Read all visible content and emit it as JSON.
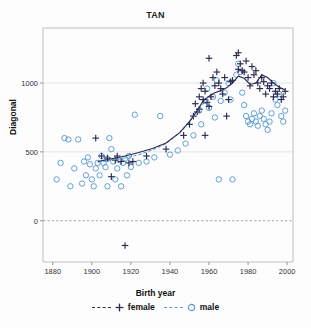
{
  "chart_data": {
    "type": "scatter",
    "title": "TAN",
    "xlabel": "Birth year",
    "ylabel": "Diagonal",
    "xlim": [
      1875,
      2003
    ],
    "ylim": [
      -300,
      1400
    ],
    "xticks": [
      1880,
      1900,
      1920,
      1940,
      1960,
      1980,
      2000
    ],
    "yticks": [
      0,
      500,
      1000
    ],
    "grid": "horizontal-faint",
    "zero_line": "dashed-gray",
    "legend_position": "bottom-center",
    "series": [
      {
        "name": "female",
        "marker": "plus",
        "color": "#2b2b52",
        "line_style": "dashed",
        "points": [
          [
            1902,
            600
          ],
          [
            1905,
            470
          ],
          [
            1908,
            455
          ],
          [
            1910,
            320
          ],
          [
            1912,
            440
          ],
          [
            1913,
            470
          ],
          [
            1915,
            430
          ],
          [
            1917,
            -180
          ],
          [
            1919,
            420
          ],
          [
            1921,
            430
          ],
          [
            1928,
            470
          ],
          [
            1938,
            520
          ],
          [
            1947,
            620
          ],
          [
            1950,
            700
          ],
          [
            1952,
            760
          ],
          [
            1953,
            850
          ],
          [
            1954,
            790
          ],
          [
            1955,
            810
          ],
          [
            1955,
            900
          ],
          [
            1956,
            960
          ],
          [
            1957,
            880
          ],
          [
            1957,
            1000
          ],
          [
            1958,
            940
          ],
          [
            1958,
            620
          ],
          [
            1959,
            860
          ],
          [
            1960,
            830
          ],
          [
            1960,
            1180
          ],
          [
            1961,
            900
          ],
          [
            1962,
            1040
          ],
          [
            1963,
            980
          ],
          [
            1964,
            1080
          ],
          [
            1965,
            1000
          ],
          [
            1966,
            960
          ],
          [
            1967,
            920
          ],
          [
            1968,
            1040
          ],
          [
            1969,
            760
          ],
          [
            1970,
            880
          ],
          [
            1971,
            1010
          ],
          [
            1972,
            1020
          ],
          [
            1974,
            1200
          ],
          [
            1975,
            1220
          ],
          [
            1975,
            1100
          ],
          [
            1976,
            1140
          ],
          [
            1977,
            1090
          ],
          [
            1978,
            1080
          ],
          [
            1979,
            1160
          ],
          [
            1980,
            1040
          ],
          [
            1981,
            980
          ],
          [
            1982,
            1120
          ],
          [
            1983,
            1060
          ],
          [
            1984,
            1090
          ],
          [
            1985,
            1000
          ],
          [
            1986,
            960
          ],
          [
            1987,
            1040
          ],
          [
            1988,
            1010
          ],
          [
            1989,
            920
          ],
          [
            1990,
            980
          ],
          [
            1991,
            960
          ],
          [
            1992,
            1000
          ],
          [
            1993,
            900
          ],
          [
            1994,
            940
          ],
          [
            1995,
            920
          ],
          [
            1996,
            960
          ],
          [
            1997,
            880
          ],
          [
            1998,
            900
          ],
          [
            1999,
            940
          ]
        ],
        "fit_curve": [
          [
            1903,
            430
          ],
          [
            1910,
            450
          ],
          [
            1917,
            470
          ],
          [
            1924,
            495
          ],
          [
            1931,
            525
          ],
          [
            1938,
            565
          ],
          [
            1945,
            640
          ],
          [
            1950,
            720
          ],
          [
            1954,
            800
          ],
          [
            1957,
            870
          ],
          [
            1960,
            905
          ],
          [
            1963,
            930
          ],
          [
            1966,
            945
          ],
          [
            1969,
            965
          ],
          [
            1972,
            1000
          ],
          [
            1975,
            1050
          ],
          [
            1978,
            1035
          ],
          [
            1981,
            990
          ],
          [
            1984,
            1000
          ],
          [
            1987,
            1060
          ],
          [
            1990,
            1040
          ],
          [
            1993,
            1000
          ],
          [
            1996,
            970
          ],
          [
            1999,
            950
          ]
        ]
      },
      {
        "name": "male",
        "marker": "circle",
        "color": "#5b9bd5",
        "line_style": "dashed",
        "points": [
          [
            1882,
            300
          ],
          [
            1884,
            420
          ],
          [
            1886,
            600
          ],
          [
            1888,
            590
          ],
          [
            1889,
            250
          ],
          [
            1891,
            380
          ],
          [
            1893,
            590
          ],
          [
            1895,
            270
          ],
          [
            1896,
            430
          ],
          [
            1897,
            330
          ],
          [
            1898,
            460
          ],
          [
            1899,
            410
          ],
          [
            1900,
            300
          ],
          [
            1901,
            250
          ],
          [
            1902,
            380
          ],
          [
            1903,
            420
          ],
          [
            1904,
            330
          ],
          [
            1905,
            470
          ],
          [
            1906,
            420
          ],
          [
            1907,
            390
          ],
          [
            1908,
            450
          ],
          [
            1908,
            250
          ],
          [
            1909,
            600
          ],
          [
            1910,
            520
          ],
          [
            1911,
            430
          ],
          [
            1912,
            300
          ],
          [
            1913,
            380
          ],
          [
            1914,
            440
          ],
          [
            1915,
            250
          ],
          [
            1916,
            420
          ],
          [
            1917,
            450
          ],
          [
            1918,
            330
          ],
          [
            1919,
            470
          ],
          [
            1920,
            390
          ],
          [
            1922,
            770
          ],
          [
            1924,
            420
          ],
          [
            1928,
            430
          ],
          [
            1932,
            460
          ],
          [
            1935,
            760
          ],
          [
            1940,
            480
          ],
          [
            1944,
            510
          ],
          [
            1948,
            560
          ],
          [
            1952,
            620
          ],
          [
            1955,
            800
          ],
          [
            1956,
            700
          ],
          [
            1958,
            870
          ],
          [
            1959,
            960
          ],
          [
            1960,
            820
          ],
          [
            1962,
            900
          ],
          [
            1963,
            750
          ],
          [
            1964,
            1020
          ],
          [
            1965,
            300
          ],
          [
            1966,
            870
          ],
          [
            1968,
            930
          ],
          [
            1970,
            1000
          ],
          [
            1971,
            880
          ],
          [
            1972,
            300
          ],
          [
            1974,
            1060
          ],
          [
            1975,
            1140
          ],
          [
            1976,
            1080
          ],
          [
            1977,
            930
          ],
          [
            1978,
            840
          ],
          [
            1979,
            760
          ],
          [
            1980,
            720
          ],
          [
            1981,
            700
          ],
          [
            1982,
            740
          ],
          [
            1983,
            780
          ],
          [
            1984,
            720
          ],
          [
            1985,
            690
          ],
          [
            1986,
            760
          ],
          [
            1987,
            800
          ],
          [
            1988,
            740
          ],
          [
            1989,
            700
          ],
          [
            1990,
            660
          ],
          [
            1991,
            720
          ],
          [
            1992,
            780
          ],
          [
            1993,
            1000
          ],
          [
            1994,
            880
          ],
          [
            1995,
            840
          ],
          [
            1996,
            920
          ],
          [
            1997,
            760
          ],
          [
            1998,
            720
          ],
          [
            1999,
            800
          ]
        ],
        "fit_curve": [
          [
            1903,
            425
          ],
          [
            1910,
            440
          ],
          [
            1917,
            455
          ],
          [
            1924,
            480
          ],
          [
            1931,
            515
          ],
          [
            1938,
            560
          ],
          [
            1945,
            640
          ],
          [
            1950,
            720
          ],
          [
            1954,
            790
          ],
          [
            1957,
            850
          ],
          [
            1960,
            880
          ]
        ]
      }
    ]
  },
  "legend": {
    "entries": [
      {
        "label": "female",
        "color": "#2b2b52",
        "marker": "plus"
      },
      {
        "label": "male",
        "color": "#5b9bd5",
        "marker": "circle"
      }
    ]
  },
  "axes": {
    "x_tick_labels": [
      "1880",
      "1900",
      "1920",
      "1940",
      "1960",
      "1980",
      "2000"
    ],
    "y_tick_labels": [
      "0",
      "500",
      "1000"
    ]
  }
}
